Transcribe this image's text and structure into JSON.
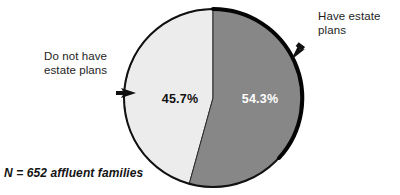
{
  "chart_data": {
    "type": "pie",
    "title": "",
    "subtitle": "",
    "xlabel": "",
    "ylabel": "",
    "legend_position": "callout-labels",
    "grid": false,
    "start_angle_deg": 0,
    "direction": "clockwise",
    "categories": [
      "Have estate plans",
      "Do not have estate plans"
    ],
    "values": [
      54.3,
      45.7
    ],
    "value_labels": [
      "54.3%",
      "45.7%"
    ],
    "colors": [
      "#878787",
      "#ececec"
    ],
    "annotations": [
      "N = 652 affluent families"
    ],
    "total_n": 652,
    "slices": [
      {
        "label": "Have estate plans",
        "value": 54.3,
        "value_label": "54.3%",
        "color": "#878787",
        "label_color": "#ffffff"
      },
      {
        "label": "Do not have estate plans",
        "value": 45.7,
        "value_label": "45.7%",
        "color": "#ececec",
        "label_color": "#111111"
      }
    ]
  },
  "labels": {
    "right_callout": "Have estate\nplans",
    "left_callout": "Do not have\nestate plans"
  },
  "values": {
    "dark_slice": "54.3%",
    "light_slice": "45.7%"
  },
  "footnote": "N = 652 affluent families",
  "style": {
    "dark_slice_color": "#878787",
    "light_slice_color": "#ececec",
    "outline_color": "#0d0d0d",
    "background": "#ffffff",
    "text_color": "#1d1d1d"
  }
}
